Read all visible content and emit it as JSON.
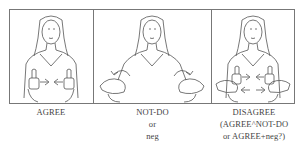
{
  "panels": [
    {
      "id": "agree",
      "caption_lines": [
        "AGREE"
      ],
      "illustration": "signer-thumbs-up-arrows-toward-center"
    },
    {
      "id": "not-do",
      "caption_lines": [
        "NOT-DO",
        "or",
        "neg"
      ],
      "illustration": "signer-open-palms-arcing-arrows"
    },
    {
      "id": "disagree",
      "caption_lines": [
        "DISAGREE",
        "(AGREE^NOT-DO",
        "or AGREE+neg?)"
      ],
      "illustration": "signer-thumbs-up-and-palms-combined-arrows"
    }
  ],
  "colors": {
    "line": "#555555",
    "frame": "#777777",
    "background": "#ffffff"
  }
}
